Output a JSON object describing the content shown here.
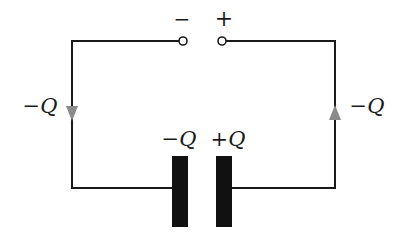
{
  "diagram": {
    "type": "circuit",
    "terminals": {
      "negative": {
        "symbol": "−"
      },
      "positive": {
        "symbol": "+"
      }
    },
    "wire_labels": {
      "left": "−Q",
      "right": "−Q"
    },
    "capacitor": {
      "left_plate_label": "−Q",
      "right_plate_label": "+Q"
    },
    "arrows": {
      "left": "down",
      "right": "up"
    },
    "colors": {
      "wire": "#1a1a1a",
      "plate": "#111111",
      "arrow": "#8a8a8a",
      "background": "#ffffff"
    }
  }
}
